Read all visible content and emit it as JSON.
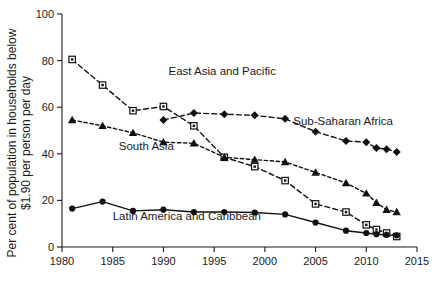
{
  "chart_data": {
    "type": "line",
    "title": "",
    "xlabel": "",
    "ylabel": "Per cent of population in households below $1.90 per person per day",
    "ylabel_line1": "Per cent of population in households below",
    "ylabel_line2": "$1.90 per person per day",
    "xlim": [
      1980,
      2015
    ],
    "ylim": [
      0,
      100
    ],
    "grid": false,
    "legend_position": "inline-annotations",
    "xticks": [
      1980,
      1985,
      1990,
      1995,
      2000,
      2005,
      2010,
      2015
    ],
    "xtick_labels": [
      "1980",
      "1985",
      "1990",
      "1995",
      "2000",
      "2005",
      "2010",
      "2015"
    ],
    "yticks": [
      0,
      20,
      40,
      60,
      80,
      100
    ],
    "ytick_labels": [
      "0",
      "20",
      "40",
      "60",
      "80",
      "100"
    ],
    "series": [
      {
        "name": "East Asia and Pacific",
        "marker": "open-square",
        "line_style": "dashed",
        "color": "#111111",
        "label_x": 1990.5,
        "label_y": 74,
        "x": [
          1981,
          1984,
          1987,
          1990,
          1993,
          1996,
          1999,
          2002,
          2005,
          2008,
          2010,
          2011,
          2012,
          2013
        ],
        "y": [
          80.5,
          69.5,
          58.5,
          60.3,
          52.0,
          38.5,
          34.5,
          28.5,
          18.5,
          15.0,
          9.5,
          7.5,
          6.0,
          4.5
        ]
      },
      {
        "name": "Sub-Saharan Africa",
        "marker": "filled-diamond",
        "line_style": "dashed",
        "color": "#111111",
        "label_x": 2002.8,
        "label_y": 52.5,
        "x": [
          1990,
          1993,
          1996,
          1999,
          2002,
          2005,
          2008,
          2010,
          2011,
          2012,
          2013
        ],
        "y": [
          54.5,
          57.5,
          57.0,
          56.5,
          55.0,
          49.5,
          45.5,
          45.0,
          42.5,
          42.0,
          40.8
        ]
      },
      {
        "name": "South Asia",
        "marker": "filled-triangle",
        "line_style": "dashed-fine",
        "color": "#111111",
        "label_x": 1985.6,
        "label_y": 41.5,
        "x": [
          1981,
          1984,
          1987,
          1990,
          1993,
          1996,
          1999,
          2002,
          2005,
          2008,
          2010,
          2011,
          2012,
          2013
        ],
        "y": [
          54.5,
          52.0,
          49.0,
          45.0,
          44.5,
          38.5,
          37.5,
          36.5,
          32.0,
          27.5,
          23.0,
          19.0,
          16.0,
          15.0
        ]
      },
      {
        "name": "Latin America and Caribbean",
        "marker": "filled-circle",
        "line_style": "solid",
        "color": "#111111",
        "label_x": 1985.0,
        "label_y": 11.5,
        "x": [
          1981,
          1984,
          1987,
          1990,
          1993,
          1996,
          1999,
          2002,
          2005,
          2008,
          2010,
          2011,
          2012,
          2013
        ],
        "y": [
          16.5,
          19.5,
          15.5,
          16.0,
          15.0,
          15.0,
          14.8,
          14.0,
          10.5,
          7.0,
          6.0,
          5.5,
          5.2,
          5.0
        ]
      }
    ]
  }
}
